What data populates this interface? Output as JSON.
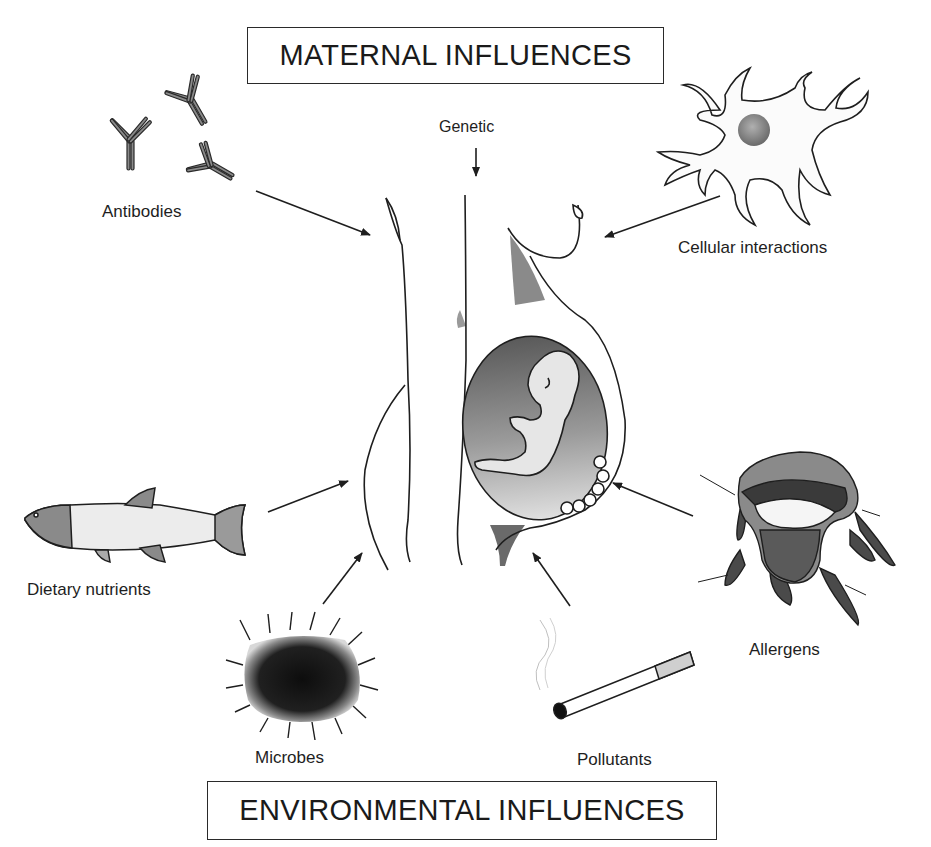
{
  "titles": {
    "maternal": "MATERNAL INFLUENCES",
    "environmental": "ENVIRONMENTAL INFLUENCES"
  },
  "maternal_influences": {
    "genetic": "Genetic",
    "antibodies": "Antibodies",
    "cellular_interactions": "Cellular interactions"
  },
  "environmental_influences": {
    "dietary_nutrients": "Dietary nutrients",
    "microbes": "Microbes",
    "pollutants": "Pollutants",
    "allergens": "Allergens"
  },
  "center": {
    "figure": "pregnant-woman-with-fetus-icon"
  },
  "icons": {
    "antibodies": "antibody-y-shape-icon",
    "cellular_interactions": "dendritic-cell-icon",
    "dietary_nutrients": "fish-icon",
    "microbes": "spiky-microbe-icon",
    "pollutants": "cigarette-icon",
    "allergens": "dust-mite-icon"
  },
  "colors": {
    "line": "#1e1e1e",
    "shade_dark": "#555555",
    "shade_mid": "#8a8a8a",
    "shade_light": "#c8c8c8",
    "background": "#ffffff"
  }
}
